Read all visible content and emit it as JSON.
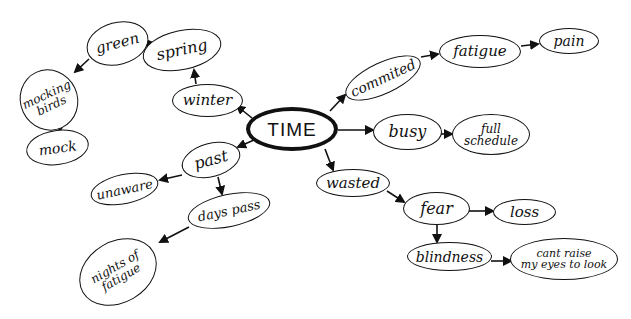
{
  "diagram": {
    "type": "mind-map",
    "style": "hand-drawn",
    "line_color": "#111111",
    "background": "#ffffff",
    "center": {
      "id": "time",
      "label": "TIME"
    },
    "nodes": [
      {
        "id": "time",
        "label": "TIME"
      },
      {
        "id": "committed",
        "label": "commited"
      },
      {
        "id": "fatigue",
        "label": "fatigue"
      },
      {
        "id": "pain",
        "label": "pain"
      },
      {
        "id": "busy",
        "label": "busy"
      },
      {
        "id": "full_schedule",
        "label": "full\nschedule"
      },
      {
        "id": "wasted",
        "label": "wasted"
      },
      {
        "id": "fear",
        "label": "fear"
      },
      {
        "id": "loss",
        "label": "loss"
      },
      {
        "id": "blindness",
        "label": "blindness"
      },
      {
        "id": "cant_raise",
        "label": "cant raise\nmy eyes to look"
      },
      {
        "id": "winter",
        "label": "winter"
      },
      {
        "id": "spring",
        "label": "spring"
      },
      {
        "id": "green",
        "label": "green"
      },
      {
        "id": "mocking_birds",
        "label": "mocking\nbirds"
      },
      {
        "id": "mock",
        "label": "mock"
      },
      {
        "id": "past",
        "label": "past"
      },
      {
        "id": "unaware",
        "label": "unaware"
      },
      {
        "id": "days_pass",
        "label": "days pass"
      },
      {
        "id": "nights_of_fatigue",
        "label": "nights of\nfatigue"
      }
    ],
    "edges": [
      {
        "from": "time",
        "to": "committed"
      },
      {
        "from": "committed",
        "to": "fatigue"
      },
      {
        "from": "fatigue",
        "to": "pain"
      },
      {
        "from": "time",
        "to": "busy"
      },
      {
        "from": "busy",
        "to": "full_schedule"
      },
      {
        "from": "time",
        "to": "wasted"
      },
      {
        "from": "wasted",
        "to": "fear"
      },
      {
        "from": "fear",
        "to": "loss"
      },
      {
        "from": "fear",
        "to": "blindness"
      },
      {
        "from": "blindness",
        "to": "cant_raise"
      },
      {
        "from": "time",
        "to": "winter"
      },
      {
        "from": "winter",
        "to": "spring"
      },
      {
        "from": "spring",
        "to": "green"
      },
      {
        "from": "green",
        "to": "mocking_birds"
      },
      {
        "from": "mocking_birds",
        "to": "mock"
      },
      {
        "from": "time",
        "to": "past"
      },
      {
        "from": "past",
        "to": "unaware"
      },
      {
        "from": "past",
        "to": "days_pass"
      },
      {
        "from": "days_pass",
        "to": "nights_of_fatigue"
      }
    ]
  }
}
